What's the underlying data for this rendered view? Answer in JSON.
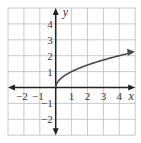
{
  "chart_data": {
    "type": "line",
    "title": "",
    "function": "y = sqrt(x)",
    "xlabel": "x",
    "ylabel": "y",
    "xlim": [
      -3,
      5
    ],
    "ylim": [
      -3,
      5
    ],
    "grid": true,
    "x_ticks": [
      "-2",
      "-1",
      "1",
      "2",
      "3",
      "4"
    ],
    "y_ticks": [
      "4",
      "3",
      "2",
      "1",
      "-1",
      "-2"
    ],
    "series": [
      {
        "name": "sqrt(x)",
        "x": [
          0,
          0.25,
          1,
          2,
          3,
          4,
          4.8
        ],
        "y": [
          0,
          0.5,
          1,
          1.41,
          1.73,
          2,
          2.19
        ],
        "end_arrow": true
      }
    ],
    "colors": {
      "grid": "#bdbdbd",
      "axis": "#222222",
      "curve": "#4a4a4a"
    }
  }
}
